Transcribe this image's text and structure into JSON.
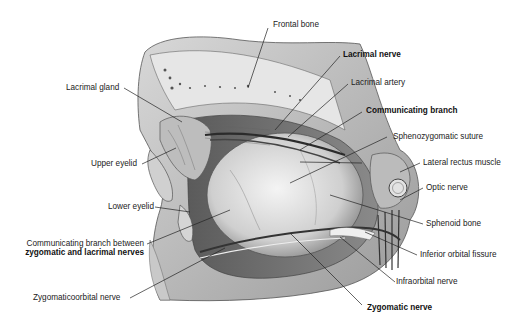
{
  "figure": {
    "labels": [
      {
        "id": "frontal-bone",
        "text": "Frontal bone",
        "bold": false
      },
      {
        "id": "lacrimal-nerve",
        "text": "Lacrimal nerve",
        "bold": true
      },
      {
        "id": "lacrimal-gland",
        "text": "Lacrimal gland",
        "bold": false
      },
      {
        "id": "lacrimal-artery",
        "text": "Lacrimal artery",
        "bold": false
      },
      {
        "id": "communicating-branch",
        "text": "Communicating branch",
        "bold": true
      },
      {
        "id": "sphenozygomatic-suture",
        "text": "Sphenozygomatic suture",
        "bold": false
      },
      {
        "id": "upper-eyelid",
        "text": "Upper eyelid",
        "bold": false
      },
      {
        "id": "lateral-rectus-muscle",
        "text": "Lateral rectus muscle",
        "bold": false
      },
      {
        "id": "optic-nerve",
        "text": "Optic nerve",
        "bold": false
      },
      {
        "id": "lower-eyelid",
        "text": "Lower eyelid",
        "bold": false
      },
      {
        "id": "sphenoid-bone",
        "text": "Sphenoid bone",
        "bold": false
      },
      {
        "id": "communicating-branch-between-line1",
        "text": "Communicating branch between",
        "bold": false
      },
      {
        "id": "communicating-branch-between-line2",
        "text": "zygomatic and lacrimal nerves",
        "bold": true
      },
      {
        "id": "inferior-orbital-fissure",
        "text": "Inferior orbital fissure",
        "bold": false
      },
      {
        "id": "infraorbital-nerve",
        "text": "Infraorbital nerve",
        "bold": false
      },
      {
        "id": "zygomaticoorbital-nerve",
        "text": "Zygomaticoorbital nerve",
        "bold": false
      },
      {
        "id": "zygomatic-nerve",
        "text": "Zygomatic nerve",
        "bold": true
      }
    ]
  }
}
